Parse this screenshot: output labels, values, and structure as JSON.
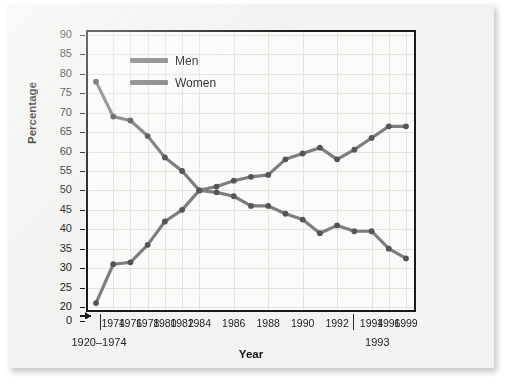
{
  "chart_data": {
    "type": "line",
    "title": "",
    "xlabel": "Year",
    "ylabel": "Percentage",
    "ylim": [
      20,
      90
    ],
    "y_axis_has_break": true,
    "y_break_base": 0,
    "yticks": [
      0,
      20,
      25,
      30,
      35,
      40,
      45,
      50,
      55,
      60,
      65,
      70,
      75,
      80,
      85,
      90
    ],
    "ytick_labels": [
      "0",
      "20",
      "25",
      "30",
      "35",
      "40",
      "45",
      "50",
      "55",
      "60",
      "65",
      "70",
      "75",
      "80",
      "85",
      "90"
    ],
    "grid": true,
    "legend_position": "top-center-left",
    "categories": [
      "1920–1974",
      "1974",
      "1976",
      "1978",
      "1980",
      "1982",
      "1984",
      "1985",
      "1986",
      "1987",
      "1988",
      "1989",
      "1990",
      "1991",
      "1992",
      "1993",
      "1994",
      "1996",
      "1999"
    ],
    "xtick_labels": [
      "1974",
      "1976",
      "1978",
      "1980",
      "1982",
      "1984",
      "1986",
      "1988",
      "1990",
      "1992",
      "1994",
      "1996",
      "1999"
    ],
    "x_group_labels": [
      "1920–1974",
      "1993"
    ],
    "series": [
      {
        "name": "Men",
        "color": "#7e7e7e",
        "values": [
          78,
          69,
          68,
          64,
          58.5,
          55,
          50,
          49.5,
          48.5,
          46,
          46,
          44,
          42.5,
          39,
          41,
          39.5,
          39.5,
          35,
          32.5
        ]
      },
      {
        "name": "Women",
        "color": "#7e7e7e",
        "values": [
          21,
          31,
          31.5,
          36,
          42,
          45,
          50,
          51,
          52.5,
          53.5,
          54,
          58,
          59.5,
          61,
          58,
          60.5,
          63.5,
          66.5,
          66.5
        ]
      }
    ],
    "legend": [
      "Men",
      "Women"
    ]
  }
}
